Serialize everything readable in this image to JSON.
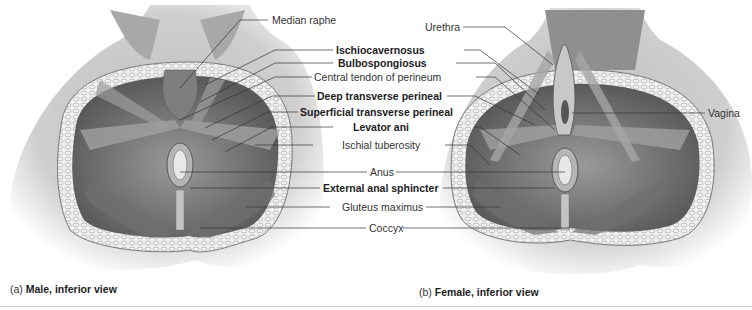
{
  "figure": {
    "panels": [
      {
        "id": "a",
        "caption_prefix": "(a)",
        "caption_title": "Male, inferior view"
      },
      {
        "id": "b",
        "caption_prefix": "(b)",
        "caption_title": "Female, inferior view"
      }
    ],
    "labels": {
      "median_raphe": "Median raphe",
      "urethra": "Urethra",
      "ischiocavernosus": "Ischiocavernosus",
      "bulbospongiosus": "Bulbospongiosus",
      "central_tendon": "Central tendon of perineum",
      "deep_transverse": "Deep transverse perineal",
      "superficial_transverse": "Superficial transverse perineal",
      "levator_ani": "Levator ani",
      "ischial_tuberosity": "Ischial tuberosity",
      "vagina": "Vagina",
      "anus": "Anus",
      "external_anal_sphincter": "External anal sphincter",
      "gluteus_maximus": "Gluteus maximus",
      "coccyx": "Coccyx"
    },
    "colors": {
      "skin": "#d9d9d9",
      "muscle": "#8a8a8a",
      "muscle_dark": "#5e5e5e",
      "fat": "#efefef",
      "leader": "#333333"
    }
  }
}
